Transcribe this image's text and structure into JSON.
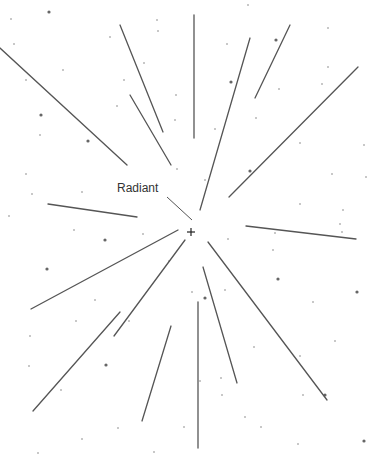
{
  "diagram": {
    "radiant_label": "Radiant",
    "radiant_point": [
      191,
      232
    ],
    "colors": {
      "line": "#555555",
      "star": "#666666",
      "background": "#ffffff"
    },
    "label_pointer": [
      [
        167,
        197
      ],
      [
        192,
        220
      ]
    ],
    "meteor_trails": [
      [
        [
          0,
          48
        ],
        [
          127,
          165
        ]
      ],
      [
        [
          120,
          25
        ],
        [
          163,
          132
        ]
      ],
      [
        [
          130,
          95
        ],
        [
          171,
          165
        ]
      ],
      [
        [
          48,
          204
        ],
        [
          137,
          217
        ]
      ],
      [
        [
          194,
          15
        ],
        [
          194,
          138
        ]
      ],
      [
        [
          250,
          38
        ],
        [
          200,
          210
        ]
      ],
      [
        [
          290,
          25
        ],
        [
          255,
          98
        ]
      ],
      [
        [
          358,
          67
        ],
        [
          229,
          197
        ]
      ],
      [
        [
          246,
          226
        ],
        [
          356,
          239
        ]
      ],
      [
        [
          178,
          230
        ],
        [
          31,
          309
        ]
      ],
      [
        [
          185,
          240
        ],
        [
          114,
          336
        ]
      ],
      [
        [
          120,
          312
        ],
        [
          33,
          411
        ]
      ],
      [
        [
          171,
          326
        ],
        [
          142,
          421
        ]
      ],
      [
        [
          198,
          302
        ],
        [
          198,
          448
        ]
      ],
      [
        [
          203,
          267
        ],
        [
          237,
          383
        ]
      ],
      [
        [
          208,
          242
        ],
        [
          327,
          400
        ]
      ]
    ],
    "stars": [
      [
        11,
        19,
        0
      ],
      [
        49,
        12,
        1
      ],
      [
        14,
        44,
        0
      ],
      [
        110,
        37,
        0
      ],
      [
        157,
        20,
        0
      ],
      [
        158,
        31,
        0
      ],
      [
        63,
        70,
        0
      ],
      [
        26,
        80,
        0
      ],
      [
        124,
        80,
        0
      ],
      [
        144,
        63,
        0
      ],
      [
        176,
        95,
        0
      ],
      [
        41,
        115,
        1
      ],
      [
        40,
        135,
        0
      ],
      [
        117,
        106,
        0
      ],
      [
        88,
        141,
        1
      ],
      [
        175,
        120,
        0
      ],
      [
        26,
        174,
        0
      ],
      [
        32,
        194,
        0
      ],
      [
        82,
        192,
        0
      ],
      [
        9,
        216,
        0
      ],
      [
        177,
        169,
        0
      ],
      [
        248,
        5,
        0
      ],
      [
        227,
        44,
        0
      ],
      [
        231,
        82,
        1
      ],
      [
        276,
        40,
        1
      ],
      [
        328,
        28,
        0
      ],
      [
        328,
        67,
        0
      ],
      [
        279,
        89,
        0
      ],
      [
        322,
        84,
        0
      ],
      [
        256,
        118,
        0
      ],
      [
        300,
        143,
        0
      ],
      [
        364,
        145,
        0
      ],
      [
        215,
        129,
        0
      ],
      [
        250,
        171,
        1
      ],
      [
        332,
        174,
        0
      ],
      [
        366,
        177,
        0
      ],
      [
        205,
        180,
        0
      ],
      [
        300,
        204,
        0
      ],
      [
        343,
        210,
        0
      ],
      [
        74,
        230,
        0
      ],
      [
        105,
        240,
        1
      ],
      [
        143,
        234,
        0
      ],
      [
        47,
        269,
        1
      ],
      [
        95,
        300,
        0
      ],
      [
        76,
        321,
        0
      ],
      [
        30,
        336,
        0
      ],
      [
        129,
        321,
        0
      ],
      [
        29,
        366,
        0
      ],
      [
        106,
        365,
        1
      ],
      [
        61,
        390,
        0
      ],
      [
        118,
        428,
        0
      ],
      [
        82,
        439,
        0
      ],
      [
        38,
        453,
        0
      ],
      [
        154,
        452,
        0
      ],
      [
        184,
        427,
        0
      ],
      [
        169,
        261,
        0
      ],
      [
        275,
        233,
        0
      ],
      [
        228,
        239,
        0
      ],
      [
        273,
        250,
        0
      ],
      [
        278,
        279,
        1
      ],
      [
        357,
        292,
        1
      ],
      [
        313,
        302,
        0
      ],
      [
        192,
        292,
        0
      ],
      [
        225,
        290,
        0
      ],
      [
        254,
        347,
        0
      ],
      [
        335,
        341,
        0
      ],
      [
        300,
        356,
        0
      ],
      [
        303,
        395,
        0
      ],
      [
        325,
        395,
        1
      ],
      [
        200,
        381,
        0
      ],
      [
        245,
        417,
        0
      ],
      [
        261,
        427,
        0
      ],
      [
        222,
        395,
        0
      ],
      [
        221,
        378,
        0
      ],
      [
        340,
        224,
        0
      ],
      [
        342,
        232,
        0
      ],
      [
        298,
        444,
        0
      ],
      [
        364,
        441,
        1
      ],
      [
        205,
        298,
        1
      ]
    ]
  }
}
